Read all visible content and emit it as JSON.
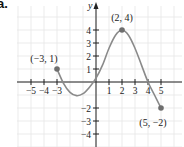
{
  "part_label": "a.",
  "chart_data": {
    "type": "line",
    "title": "",
    "xlabel": "",
    "ylabel": "y",
    "xlim": [
      -6,
      6.6
    ],
    "ylim": [
      -5,
      6.1
    ],
    "grid": true,
    "x_ticks": [
      -5,
      -4,
      -3,
      1,
      2,
      3,
      4,
      5
    ],
    "x_tick_labels": [
      "−5",
      "−4",
      "−3",
      "1",
      "2",
      "3",
      "4",
      "5"
    ],
    "y_ticks": [
      4,
      3,
      2,
      1,
      -2,
      -3,
      -4
    ],
    "y_tick_labels": [
      "4",
      "3",
      "2",
      "1",
      "−2",
      "−3",
      "−4"
    ],
    "series": [
      {
        "name": "f(x)",
        "x": [
          -3,
          -2.5,
          -2,
          -1.5,
          -1,
          -0.5,
          0,
          0.5,
          1,
          1.5,
          2,
          2.5,
          3,
          3.5,
          4,
          4.5,
          5
        ],
        "y": [
          1,
          -0.1,
          -0.8,
          -1.05,
          -0.9,
          -0.4,
          0.3,
          1.3,
          2.6,
          3.6,
          4,
          3.6,
          2.6,
          1.3,
          0,
          -1,
          -2
        ]
      }
    ],
    "annotations": [
      {
        "x": -3,
        "y": 1,
        "text": "(−3, 1)"
      },
      {
        "x": 2,
        "y": 4,
        "text": "(2, 4)"
      },
      {
        "x": 5,
        "y": -2,
        "text": "(5, −2)"
      }
    ],
    "colors": {
      "curve": "#8a8a8a",
      "point": "#6e6e6e",
      "axis": "#222222",
      "grid": "#e6e6e6",
      "text": "#222222"
    }
  }
}
